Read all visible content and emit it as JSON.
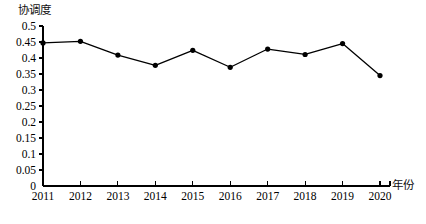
{
  "chart_data": {
    "type": "line",
    "title": "",
    "xlabel": "年份",
    "ylabel": "协调度",
    "categories": [
      "2011",
      "2012",
      "2013",
      "2014",
      "2015",
      "2016",
      "2017",
      "2018",
      "2019",
      "2020"
    ],
    "values": [
      0.447,
      0.452,
      0.409,
      0.377,
      0.424,
      0.371,
      0.428,
      0.411,
      0.445,
      0.345
    ],
    "series": [
      {
        "name": "协调度",
        "values": [
          0.447,
          0.452,
          0.409,
          0.377,
          0.424,
          0.371,
          0.428,
          0.411,
          0.445,
          0.345
        ]
      }
    ],
    "ylim": [
      0,
      0.5
    ],
    "ytick_labels": [
      "0",
      "0.05",
      "0.1",
      "0.15",
      "0.2",
      "0.25",
      "0.3",
      "0.35",
      "0.4",
      "0.45",
      "0.5"
    ],
    "ytick_values": [
      0,
      0.05,
      0.1,
      0.15,
      0.2,
      0.25,
      0.3,
      0.35,
      0.4,
      0.45,
      0.5
    ],
    "xtick_labels": [
      "2011",
      "2012",
      "2013",
      "2014",
      "2015",
      "2016",
      "2017",
      "2018",
      "2019",
      "2020"
    ],
    "grid": false,
    "legend": "none",
    "line_color": "#000000",
    "marker": "filled-circle",
    "marker_color": "#000000",
    "axis_color": "#000000"
  },
  "figure": {
    "caption": ""
  }
}
